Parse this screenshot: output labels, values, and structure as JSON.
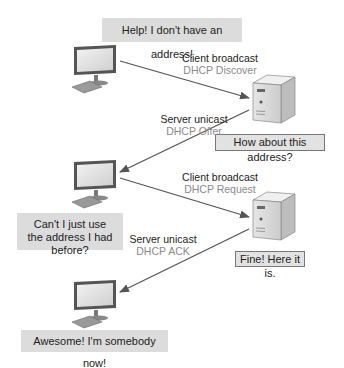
{
  "title_fragment": "",
  "messages": {
    "client_1": "Help! I don't have an address!",
    "server_1": "How about this address?",
    "client_2": "Can't I just use the address I had before?",
    "server_2": "Fine! Here it is.",
    "client_3": "Awesome! I'm somebody now!"
  },
  "arrows": [
    {
      "type": "Client broadcast",
      "message": "DHCP Discover"
    },
    {
      "type": "Server unicast",
      "message": "DHCP Offer"
    },
    {
      "type": "Client broadcast",
      "message": "DHCP Request"
    },
    {
      "type": "Server unicast",
      "message": "DHCP ACK"
    }
  ],
  "colors": {
    "bubble_fill": "#dcdcdc",
    "bubble_border": "#777777",
    "arrow": "#555555",
    "label_primary": "#222222",
    "label_secondary": "#8a8a8a"
  }
}
